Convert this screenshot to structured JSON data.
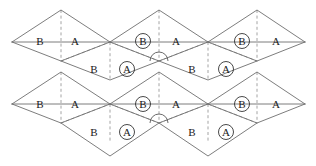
{
  "figure": {
    "width": 316,
    "height": 166,
    "background_color": "#ffffff",
    "solid_line_color": "#6e6e6e",
    "dashed_line_color": "#8d8d8d",
    "label_color": "#1a1a1a",
    "arc_color": "#5a5a5a"
  },
  "labels": {
    "plain_a": "A",
    "plain_b": "B",
    "circled_a": "A",
    "circled_b": "B"
  },
  "top_row": {
    "upper_band": [
      {
        "text": "B",
        "circled": false,
        "x": 40,
        "y": 41
      },
      {
        "text": "A",
        "circled": false,
        "x": 75,
        "y": 41
      },
      {
        "text": "B",
        "circled": true,
        "x": 143,
        "y": 41
      },
      {
        "text": "A",
        "circled": false,
        "x": 176,
        "y": 41
      },
      {
        "text": "B",
        "circled": true,
        "x": 242,
        "y": 41
      },
      {
        "text": "A",
        "circled": false,
        "x": 276,
        "y": 41
      }
    ],
    "lower_band": [
      {
        "text": "B",
        "circled": false,
        "x": 94,
        "y": 69
      },
      {
        "text": "A",
        "circled": true,
        "x": 127,
        "y": 69
      },
      {
        "text": "B",
        "circled": false,
        "x": 192,
        "y": 69
      },
      {
        "text": "A",
        "circled": true,
        "x": 226,
        "y": 69
      }
    ]
  },
  "bottom_row": {
    "upper_band": [
      {
        "text": "B",
        "circled": false,
        "x": 40,
        "y": 104
      },
      {
        "text": "A",
        "circled": false,
        "x": 75,
        "y": 104
      },
      {
        "text": "B",
        "circled": true,
        "x": 143,
        "y": 104
      },
      {
        "text": "A",
        "circled": false,
        "x": 176,
        "y": 104
      },
      {
        "text": "B",
        "circled": true,
        "x": 242,
        "y": 104
      },
      {
        "text": "A",
        "circled": false,
        "x": 276,
        "y": 104
      }
    ],
    "lower_band": [
      {
        "text": "B",
        "circled": false,
        "x": 94,
        "y": 132
      },
      {
        "text": "A",
        "circled": true,
        "x": 127,
        "y": 132
      },
      {
        "text": "B",
        "circled": false,
        "x": 192,
        "y": 132
      },
      {
        "text": "A",
        "circled": true,
        "x": 226,
        "y": 132
      }
    ]
  },
  "arc_marks": [
    {
      "cx": 159,
      "cy": 61,
      "r": 9
    },
    {
      "cx": 159,
      "cy": 123,
      "r": 9
    }
  ],
  "geometry": {
    "apex_x": [
      61,
      159,
      257
    ],
    "left_x": 12,
    "right_x": 305,
    "top_apex_y": 10,
    "mid_y": 42,
    "zig_peak_y": 61,
    "zig_valley_y": 80,
    "bottom_apex_y": 72,
    "bottom_mid_y": 104,
    "bottom_zig_peak_y": 123,
    "bottom_valley_y": 156
  }
}
